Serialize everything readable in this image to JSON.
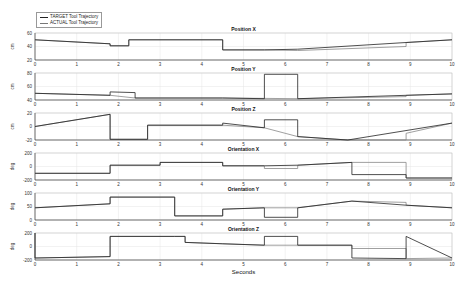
{
  "legend": {
    "target": "TARGET Tool Trajectory",
    "actual": "ACTUAL Tool Trajectory"
  },
  "xlabel": "Seconds",
  "chart_data": [
    {
      "type": "line",
      "title": "Position X",
      "ylabel": "cm",
      "ylim": [
        20,
        60
      ],
      "yticks": [
        "20",
        "40",
        "60"
      ],
      "xlim": [
        0,
        10
      ],
      "series": [
        {
          "name": "TARGET",
          "x": [
            0,
            1.8,
            1.8,
            2.25,
            2.25,
            4.5,
            4.5,
            5.5,
            6.3,
            8.9,
            10
          ],
          "values": [
            50,
            44,
            41,
            41,
            50,
            50,
            35,
            35,
            36,
            46,
            50
          ]
        },
        {
          "name": "ACTUAL",
          "x": [
            0,
            1.8,
            1.8,
            2.25,
            2.25,
            4.5,
            4.5,
            5.5,
            6.3,
            8.9,
            8.9,
            10
          ],
          "values": [
            50,
            44,
            41,
            41,
            50,
            50,
            35,
            35,
            34,
            40,
            46,
            50
          ]
        }
      ]
    },
    {
      "type": "line",
      "title": "Position Y",
      "ylabel": "cm",
      "ylim": [
        40,
        80
      ],
      "yticks": [
        "40",
        "60",
        "80"
      ],
      "xlim": [
        0,
        10
      ],
      "series": [
        {
          "name": "TARGET",
          "x": [
            0,
            1.8,
            1.8,
            2.4,
            2.4,
            4.5,
            4.5,
            5.5,
            5.5,
            6.3,
            6.3,
            10
          ],
          "values": [
            50,
            47,
            52,
            51,
            43,
            43,
            43,
            42,
            78,
            78,
            42,
            49
          ]
        },
        {
          "name": "ACTUAL",
          "x": [
            0,
            1.8,
            2.4,
            4.5,
            6.3,
            8.9,
            8.9,
            10
          ],
          "values": [
            50,
            47,
            43,
            43,
            42,
            45,
            47,
            49
          ]
        }
      ]
    },
    {
      "type": "line",
      "title": "Position Z",
      "ylabel": "cm",
      "ylim": [
        -20,
        20
      ],
      "yticks": [
        "-20",
        "0",
        "20"
      ],
      "xlim": [
        0,
        10
      ],
      "series": [
        {
          "name": "TARGET",
          "x": [
            0,
            1.8,
            1.8,
            2.7,
            2.7,
            4.5,
            4.5,
            5.5,
            5.5,
            6.3,
            6.3,
            7.5,
            10
          ],
          "values": [
            0,
            18,
            -19,
            -19,
            2,
            2,
            5,
            -2,
            10,
            10,
            -15,
            -20,
            5
          ]
        },
        {
          "name": "ACTUAL",
          "x": [
            0,
            1.8,
            1.8,
            2.7,
            2.7,
            4.5,
            5.5,
            6.3,
            7.5,
            8.9,
            8.9,
            10
          ],
          "values": [
            0,
            18,
            -19,
            -19,
            2,
            2,
            -2,
            -15,
            -20,
            -20,
            -10,
            5
          ]
        }
      ]
    },
    {
      "type": "line",
      "title": "Orientation X",
      "ylabel": "deg",
      "ylim": [
        -200,
        200
      ],
      "yticks": [
        "-200",
        "0",
        "200"
      ],
      "xlim": [
        0,
        10
      ],
      "series": [
        {
          "name": "TARGET",
          "x": [
            0,
            1.8,
            1.8,
            3,
            3,
            4.5,
            4.5,
            5.5,
            6.3,
            7.6,
            7.6,
            8.9,
            8.9,
            10
          ],
          "values": [
            -100,
            -100,
            20,
            20,
            60,
            60,
            10,
            10,
            20,
            60,
            -120,
            -120,
            -170,
            -170
          ]
        },
        {
          "name": "ACTUAL",
          "x": [
            0,
            1.8,
            1.8,
            3,
            3,
            4.5,
            4.5,
            5.5,
            5.5,
            6.3,
            6.3,
            7.6,
            8.9,
            8.9,
            10
          ],
          "values": [
            -100,
            -100,
            20,
            20,
            60,
            60,
            10,
            10,
            -30,
            -30,
            20,
            60,
            60,
            -170,
            -170
          ]
        }
      ]
    },
    {
      "type": "line",
      "title": "Orientation Y",
      "ylabel": "deg",
      "ylim": [
        0,
        100
      ],
      "yticks": [
        "0",
        "50",
        "100"
      ],
      "xlim": [
        0,
        10
      ],
      "series": [
        {
          "name": "TARGET",
          "x": [
            0,
            1.8,
            1.8,
            3.35,
            3.35,
            4.5,
            4.5,
            5.5,
            5.5,
            6.3,
            6.3,
            7.6,
            8.9,
            10
          ],
          "values": [
            45,
            60,
            85,
            85,
            15,
            15,
            40,
            45,
            10,
            10,
            45,
            70,
            55,
            45
          ]
        },
        {
          "name": "ACTUAL",
          "x": [
            0,
            1.8,
            1.8,
            3.35,
            3.35,
            4.5,
            4.5,
            5.5,
            6.3,
            7.6,
            8.9,
            8.9,
            10
          ],
          "values": [
            45,
            60,
            85,
            85,
            15,
            15,
            40,
            45,
            45,
            70,
            65,
            55,
            45
          ]
        }
      ]
    },
    {
      "type": "line",
      "title": "Orientation Z",
      "ylabel": "deg",
      "ylim": [
        -200,
        200
      ],
      "yticks": [
        "-200",
        "0",
        "200"
      ],
      "xlim": [
        0,
        10
      ],
      "series": [
        {
          "name": "TARGET",
          "x": [
            0,
            0,
            1.8,
            1.8,
            3.35,
            3.35,
            3.6,
            3.6,
            4.5,
            5.5,
            5.5,
            6.3,
            6.3,
            7.6,
            7.6,
            8.9,
            8.9,
            10
          ],
          "values": [
            200,
            -170,
            -150,
            150,
            150,
            150,
            150,
            60,
            40,
            20,
            150,
            150,
            20,
            20,
            -170,
            -180,
            150,
            -170
          ]
        },
        {
          "name": "ACTUAL",
          "x": [
            0,
            1.8,
            1.8,
            3.35,
            3.6,
            3.6,
            5.5,
            6.3,
            7.6,
            7.6,
            8.9,
            8.9,
            10
          ],
          "values": [
            -170,
            -150,
            150,
            150,
            150,
            60,
            20,
            20,
            20,
            -30,
            -30,
            -180,
            -170
          ]
        }
      ]
    }
  ],
  "xticks": [
    "0",
    "1",
    "2",
    "3",
    "4",
    "5",
    "6",
    "7",
    "8",
    "9",
    "10"
  ]
}
